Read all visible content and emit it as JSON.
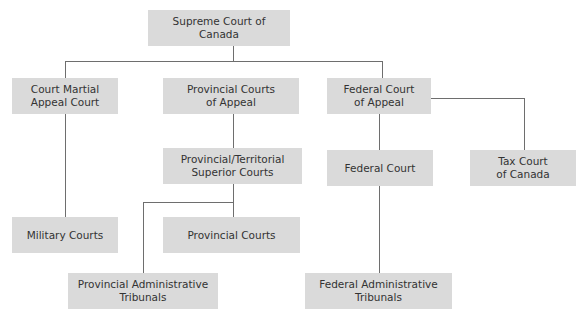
{
  "diagram": {
    "type": "org-chart",
    "colors": {
      "box_fill": "#dadada",
      "text": "#333333",
      "line": "#6e6e6e",
      "background": "#ffffff"
    },
    "nodes": {
      "supreme": {
        "label": "Supreme Court of Canada"
      },
      "court_martial_appeal": {
        "label": "Court Martial\nAppeal Court"
      },
      "provincial_appeal": {
        "label": "Provincial Courts\nof Appeal"
      },
      "federal_appeal": {
        "label": "Federal Court\nof Appeal"
      },
      "prov_superior": {
        "label": "Provincial/Territorial\nSuperior Courts"
      },
      "federal_court": {
        "label": "Federal Court"
      },
      "tax_court": {
        "label": "Tax Court\nof Canada"
      },
      "military": {
        "label": "Military Courts"
      },
      "provincial_courts": {
        "label": "Provincial Courts"
      },
      "prov_admin": {
        "label": "Provincial Administrative\nTribunals"
      },
      "fed_admin": {
        "label": "Federal Administrative\nTribunals"
      }
    },
    "edges": [
      [
        "supreme",
        "court_martial_appeal"
      ],
      [
        "supreme",
        "provincial_appeal"
      ],
      [
        "supreme",
        "federal_appeal"
      ],
      [
        "court_martial_appeal",
        "military"
      ],
      [
        "provincial_appeal",
        "prov_superior"
      ],
      [
        "prov_superior",
        "provincial_courts"
      ],
      [
        "prov_superior",
        "prov_admin"
      ],
      [
        "federal_appeal",
        "federal_court"
      ],
      [
        "federal_appeal",
        "tax_court"
      ],
      [
        "federal_court",
        "fed_admin"
      ]
    ]
  }
}
